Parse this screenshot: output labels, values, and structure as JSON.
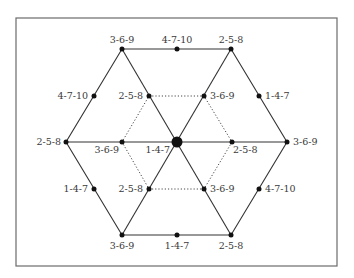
{
  "diagram": {
    "frame": {
      "x": 16,
      "y": 18,
      "width": 321,
      "height": 248,
      "stroke": "#6b6b6b"
    },
    "line_color": "#333333",
    "center": {
      "x": 177,
      "y": 142,
      "label": "1-4-7"
    },
    "outer_vertices": [
      {
        "id": "top-left",
        "x": 122,
        "y": 49,
        "label": "3-6-9"
      },
      {
        "id": "top-right",
        "x": 231,
        "y": 49,
        "label": "2-5-8"
      },
      {
        "id": "right",
        "x": 287,
        "y": 142,
        "label": "3-6-9"
      },
      {
        "id": "bottom-right",
        "x": 231,
        "y": 235,
        "label": "2-5-8"
      },
      {
        "id": "bottom-left",
        "x": 122,
        "y": 235,
        "label": "3-6-9"
      },
      {
        "id": "left",
        "x": 66,
        "y": 142,
        "label": "2-5-8"
      }
    ],
    "edge_midpoints": [
      {
        "id": "top",
        "x": 177,
        "y": 49,
        "label": "4-7-10"
      },
      {
        "id": "upper-right",
        "x": 259,
        "y": 96,
        "label": "1-4-7"
      },
      {
        "id": "lower-right",
        "x": 259,
        "y": 189,
        "label": "4-7-10"
      },
      {
        "id": "bottom",
        "x": 177,
        "y": 235,
        "label": "1-4-7"
      },
      {
        "id": "lower-left",
        "x": 94,
        "y": 189,
        "label": "1-4-7"
      },
      {
        "id": "upper-left",
        "x": 94,
        "y": 96,
        "label": "4-7-10"
      }
    ],
    "inner_points": [
      {
        "id": "inner-top-left",
        "x": 149,
        "y": 96,
        "label": "2-5-8"
      },
      {
        "id": "inner-top-right",
        "x": 204,
        "y": 96,
        "label": "3-6-9"
      },
      {
        "id": "inner-right",
        "x": 232,
        "y": 142,
        "label": "2-5-8"
      },
      {
        "id": "inner-bottom-right",
        "x": 204,
        "y": 189,
        "label": "3-6-9"
      },
      {
        "id": "inner-bottom-left",
        "x": 149,
        "y": 189,
        "label": "2-5-8"
      },
      {
        "id": "inner-left",
        "x": 122,
        "y": 142,
        "label": "3-6-9"
      }
    ]
  }
}
